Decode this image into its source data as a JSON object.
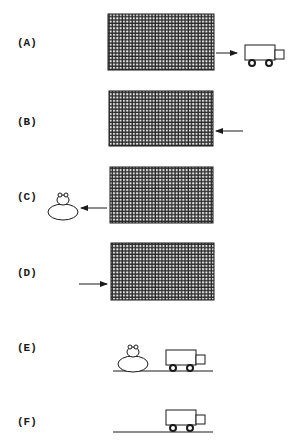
{
  "figure": {
    "panels": [
      {
        "id": "A",
        "label": "(A)",
        "label_pos": [
          17,
          37
        ],
        "screen": [
          108,
          14,
          106,
          56
        ],
        "arrow": {
          "from": [
            215,
            53
          ],
          "to": [
            237,
            53
          ],
          "direction": "right"
        },
        "objects": [
          "truck"
        ]
      },
      {
        "id": "B",
        "label": "(B)",
        "label_pos": [
          17,
          116
        ],
        "screen": [
          109,
          91,
          104,
          55
        ],
        "arrow": {
          "from": [
            243,
            131
          ],
          "to": [
            216,
            131
          ],
          "direction": "left"
        },
        "objects": []
      },
      {
        "id": "C",
        "label": "(C)",
        "label_pos": [
          17,
          191
        ],
        "screen": [
          110,
          167,
          103,
          56
        ],
        "arrow": {
          "from": [
            107,
            208
          ],
          "to": [
            81,
            208
          ],
          "direction": "left"
        },
        "objects": [
          "frog"
        ]
      },
      {
        "id": "D",
        "label": "(D)",
        "label_pos": [
          17,
          267
        ],
        "screen": [
          111,
          243,
          103,
          57
        ],
        "arrow": {
          "from": [
            79,
            284
          ],
          "to": [
            107,
            284
          ],
          "direction": "right"
        },
        "objects": []
      },
      {
        "id": "E",
        "label": "(E)",
        "label_pos": [
          17,
          342
        ],
        "ground": [
          113,
          213,
          371
        ],
        "objects": [
          "frog",
          "truck"
        ]
      },
      {
        "id": "F",
        "label": "(F)",
        "label_pos": [
          17,
          416
        ],
        "ground": [
          113,
          213,
          432
        ],
        "objects": [
          "truck"
        ]
      }
    ],
    "colors": {
      "ink": "#1a1a1a",
      "grid_bg": "#f2f2f2"
    }
  }
}
